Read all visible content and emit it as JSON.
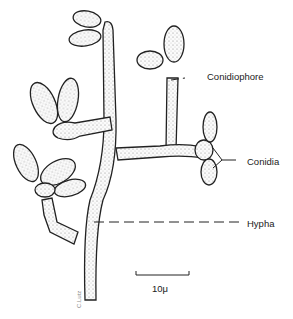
{
  "figure": {
    "labels": {
      "conidiophore": "Conidiophore",
      "conidia": "Conidia",
      "hypha": "Hypha"
    },
    "scale_bar": {
      "label": "10μ"
    },
    "signature": "C.Lutz"
  }
}
